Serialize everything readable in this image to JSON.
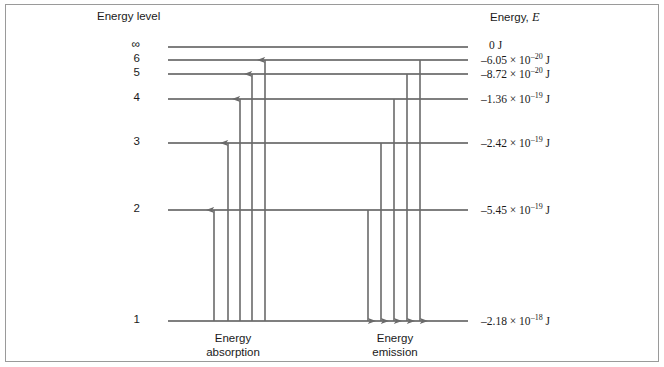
{
  "figure": {
    "headers": {
      "left": "Energy level",
      "right_prefix": "Energy, ",
      "right_symbol": "E"
    },
    "captions": {
      "absorption_line1": "Energy",
      "absorption_line2": "absorption",
      "emission_line1": "Energy",
      "emission_line2": "emission"
    },
    "colors": {
      "level_line": "#555555",
      "arrow": "#6a6a6a",
      "border": "#9a9a9a",
      "text": "#1a1a1a",
      "background": "#ffffff"
    }
  },
  "chart_data": {
    "type": "diagram",
    "xlabel": "",
    "ylabel": "Energy, E",
    "grid": false,
    "legend": "none",
    "levels": [
      {
        "name": "infinity",
        "label": "∞",
        "y": 47,
        "energy_text": "0 J",
        "mantissa": "0",
        "exponent": "",
        "unit": "J",
        "value_j": 0
      },
      {
        "name": "6",
        "label": "6",
        "y": 60,
        "energy_text": "–6.05 × 10⁻²⁰ J",
        "mantissa": "–6.05",
        "exponent": "–20",
        "unit": "J",
        "value_j": -6.05e-20
      },
      {
        "name": "5",
        "label": "5",
        "y": 74,
        "energy_text": "–8.72 × 10⁻²⁰ J",
        "mantissa": "–8.72",
        "exponent": "–20",
        "unit": "J",
        "value_j": -8.72e-20
      },
      {
        "name": "4",
        "label": "4",
        "y": 99,
        "energy_text": "–1.36 × 10⁻¹⁹ J",
        "mantissa": "–1.36",
        "exponent": "–19",
        "unit": "J",
        "value_j": -1.36e-19
      },
      {
        "name": "3",
        "label": "3",
        "y": 143,
        "energy_text": "–2.42 × 10⁻¹⁹ J",
        "mantissa": "–2.42",
        "exponent": "–19",
        "unit": "J",
        "value_j": -2.42e-19
      },
      {
        "name": "2",
        "label": "2",
        "y": 210,
        "energy_text": "–5.45 × 10⁻¹⁹ J",
        "mantissa": "–5.45",
        "exponent": "–19",
        "unit": "J",
        "value_j": -5.45e-19
      },
      {
        "name": "1",
        "label": "1",
        "y": 321,
        "energy_text": "–2.18 × 10⁻¹⁸ J",
        "mantissa": "–2.18",
        "exponent": "–18",
        "unit": "J",
        "value_j": -2.18e-18
      }
    ],
    "line_extent": {
      "x_start": 168,
      "x_end": 468
    },
    "transitions": {
      "absorption": [
        {
          "name": "absorption-1-to-2",
          "x": 214,
          "from_level": "1",
          "to_level": "2",
          "direction": "up"
        },
        {
          "name": "absorption-1-to-3",
          "x": 228,
          "from_level": "1",
          "to_level": "3",
          "direction": "up"
        },
        {
          "name": "absorption-1-to-4",
          "x": 240,
          "from_level": "1",
          "to_level": "4",
          "direction": "up"
        },
        {
          "name": "absorption-1-to-5",
          "x": 252,
          "from_level": "1",
          "to_level": "5",
          "direction": "up"
        },
        {
          "name": "absorption-1-to-6",
          "x": 265,
          "from_level": "1",
          "to_level": "6",
          "direction": "up"
        }
      ],
      "emission": [
        {
          "name": "emission-2-to-1",
          "x": 368,
          "from_level": "2",
          "to_level": "1",
          "direction": "down"
        },
        {
          "name": "emission-3-to-1",
          "x": 381,
          "from_level": "3",
          "to_level": "1",
          "direction": "down"
        },
        {
          "name": "emission-4-to-1",
          "x": 394,
          "from_level": "4",
          "to_level": "1",
          "direction": "down"
        },
        {
          "name": "emission-5-to-1",
          "x": 407,
          "from_level": "5",
          "to_level": "1",
          "direction": "down"
        },
        {
          "name": "emission-6-to-1",
          "x": 420,
          "from_level": "6",
          "to_level": "1",
          "direction": "down"
        }
      ]
    }
  }
}
